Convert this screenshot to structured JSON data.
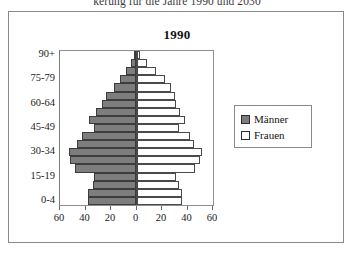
{
  "caption": "kerung für die Jahre 1990 und 2030",
  "chart_title": "1990",
  "legend": {
    "male_label": "Männer",
    "female_label": "Frauen",
    "male_color": "#7d7d7d",
    "female_color": "#ffffff"
  },
  "chart_data": {
    "type": "bar",
    "subtype": "population-pyramid",
    "title": "1990",
    "xlabel": "",
    "ylabel": "",
    "grid": false,
    "legend_position": "right",
    "xlim": [
      -60,
      60
    ],
    "xticks": [
      60,
      40,
      20,
      0,
      20,
      40,
      60
    ],
    "xtick_labels": [
      "60",
      "40",
      "20",
      "0",
      "20",
      "40",
      "60"
    ],
    "categories": [
      "0-4",
      "5-9",
      "10-14",
      "15-19",
      "20-24",
      "25-29",
      "30-34",
      "35-39",
      "40-44",
      "45-49",
      "50-54",
      "55-59",
      "60-64",
      "65-69",
      "70-74",
      "75-79",
      "80-84",
      "85-89",
      "90+"
    ],
    "ytick_labels": [
      "0-4",
      "15-19",
      "30-34",
      "45-49",
      "60-64",
      "75-79",
      "90+"
    ],
    "series": [
      {
        "name": "Männer",
        "color": "#7d7d7d",
        "side": "left",
        "values": [
          38,
          38,
          34,
          33,
          48,
          52,
          53,
          47,
          43,
          33,
          37,
          32,
          27,
          24,
          18,
          13,
          8,
          4,
          2
        ]
      },
      {
        "name": "Frauen",
        "color": "#ffffff",
        "side": "right",
        "values": [
          36,
          36,
          33,
          31,
          46,
          50,
          51,
          45,
          42,
          33,
          38,
          34,
          31,
          30,
          27,
          22,
          15,
          8,
          3
        ]
      }
    ]
  }
}
